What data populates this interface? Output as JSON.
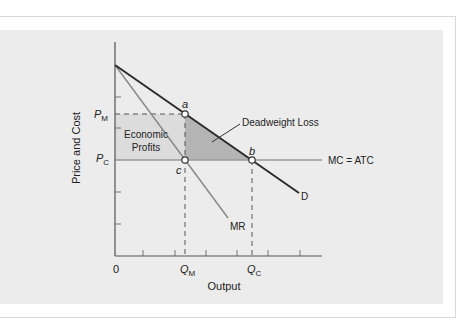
{
  "diagram": {
    "y_axis_label": "Price and Cost",
    "x_axis_label": "Output",
    "origin_label": "0",
    "price_labels": {
      "pm_main": "P",
      "pm_sub": "M",
      "pc_main": "P",
      "pc_sub": "C"
    },
    "quantity_labels": {
      "qm_main": "Q",
      "qm_sub": "M",
      "qc_main": "Q",
      "qc_sub": "C"
    },
    "points": {
      "a": "a",
      "b": "b",
      "c": "c"
    },
    "curves": {
      "demand": "D",
      "marginal_revenue": "MR",
      "mc_atc": "MC = ATC"
    },
    "regions": {
      "profits_line1": "Economic",
      "profits_line2": "Profits",
      "deadweight_loss": "Deadweight Loss"
    },
    "colors": {
      "background": "#ececec",
      "profits_fill": "#dcdcdc",
      "deadweight_fill": "#b4b4b4",
      "demand_line": "#2a2a2a",
      "mr_line": "#8a8a8a",
      "mc_line": "#9a9a9a",
      "axis": "#555555"
    }
  }
}
